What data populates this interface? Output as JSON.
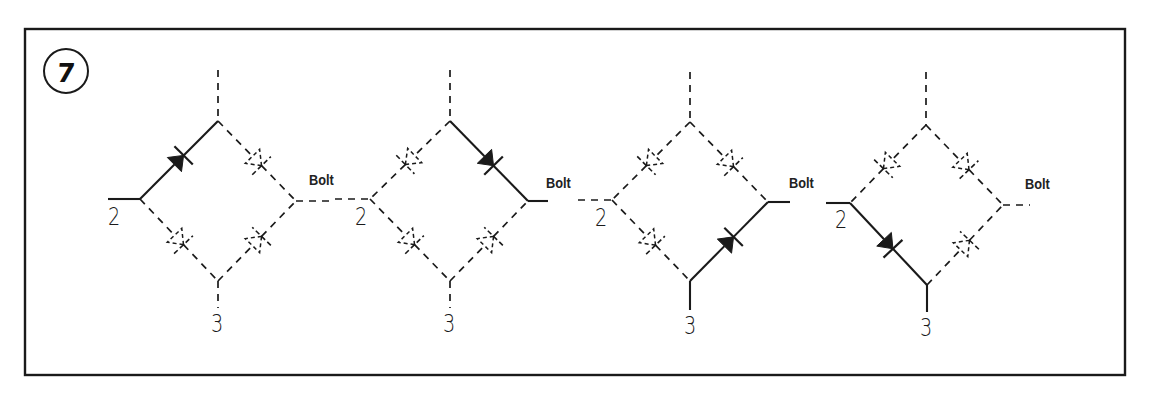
{
  "figure": {
    "number": "7",
    "frame": {
      "x": 25,
      "y": 29,
      "w": 1100,
      "h": 346
    },
    "stroke_color": "#1a1a1a",
    "background": "#ffffff"
  },
  "labels": {
    "terminal_1": "1",
    "terminal_2": "2",
    "terminal_3": "3",
    "output": "Bolt"
  },
  "bridges": [
    {
      "id": 1,
      "top": [
        218,
        121
      ],
      "left": [
        140,
        199
      ],
      "right": [
        296,
        201
      ],
      "bottom": [
        218,
        281
      ],
      "leads": {
        "top": {
          "from": [
            218,
            70
          ],
          "style": "dashed"
        },
        "left": {
          "from": [
            108,
            199
          ],
          "style": "solid"
        },
        "right": {
          "to": [
            330,
            201
          ],
          "style": "dashed"
        },
        "bottom": {
          "to": [
            218,
            308
          ],
          "style": "dashed"
        }
      },
      "edges": [
        {
          "a": "left",
          "b": "top",
          "conducting": true,
          "dir": "a_to_b"
        },
        {
          "a": "top",
          "b": "right",
          "conducting": false,
          "dir": "a_to_b"
        },
        {
          "a": "left",
          "b": "bottom",
          "conducting": false,
          "dir": "a_to_b"
        },
        {
          "a": "bottom",
          "b": "right",
          "conducting": false,
          "dir": "a_to_b"
        }
      ],
      "label_pos": {
        "two": [
          108,
          205
        ],
        "three": [
          211,
          312
        ],
        "bolt": [
          309,
          172
        ]
      }
    },
    {
      "id": 2,
      "top": [
        450,
        121
      ],
      "left": [
        370,
        199
      ],
      "right": [
        528,
        201
      ],
      "bottom": [
        450,
        281
      ],
      "leads": {
        "top": {
          "from": [
            450,
            70
          ],
          "style": "dashed"
        },
        "left": {
          "from": [
            335,
            199
          ],
          "style": "dashed"
        },
        "right": {
          "to": [
            548,
            201
          ],
          "style": "solid"
        },
        "bottom": {
          "to": [
            450,
            308
          ],
          "style": "dashed"
        }
      },
      "edges": [
        {
          "a": "left",
          "b": "top",
          "conducting": false,
          "dir": "b_to_a"
        },
        {
          "a": "top",
          "b": "right",
          "conducting": true,
          "dir": "a_to_b"
        },
        {
          "a": "left",
          "b": "bottom",
          "conducting": false,
          "dir": "a_to_b"
        },
        {
          "a": "bottom",
          "b": "right",
          "conducting": false,
          "dir": "a_to_b"
        }
      ],
      "label_pos": {
        "two": [
          355,
          205
        ],
        "three": [
          443,
          312
        ],
        "bolt": [
          546,
          175
        ]
      }
    },
    {
      "id": 3,
      "top": [
        690,
        122
      ],
      "left": [
        612,
        200
      ],
      "right": [
        768,
        202
      ],
      "bottom": [
        690,
        281
      ],
      "leads": {
        "top": {
          "from": [
            690,
            72
          ],
          "style": "dashed"
        },
        "left": {
          "from": [
            578,
            200
          ],
          "style": "dashed"
        },
        "right": {
          "to": [
            790,
            202
          ],
          "style": "solid"
        },
        "bottom": {
          "to": [
            690,
            310
          ],
          "style": "solid"
        }
      },
      "edges": [
        {
          "a": "left",
          "b": "top",
          "conducting": false,
          "dir": "b_to_a"
        },
        {
          "a": "top",
          "b": "right",
          "conducting": false,
          "dir": "a_to_b"
        },
        {
          "a": "left",
          "b": "bottom",
          "conducting": false,
          "dir": "a_to_b"
        },
        {
          "a": "bottom",
          "b": "right",
          "conducting": true,
          "dir": "a_to_b"
        }
      ],
      "label_pos": {
        "two": [
          595,
          206
        ],
        "three": [
          684,
          314
        ],
        "bolt": [
          789,
          175
        ]
      }
    },
    {
      "id": 4,
      "top": [
        926,
        125
      ],
      "left": [
        850,
        203
      ],
      "right": [
        1003,
        205
      ],
      "bottom": [
        927,
        285
      ],
      "leads": {
        "top": {
          "from": [
            926,
            72
          ],
          "style": "dashed"
        },
        "left": {
          "from": [
            826,
            203
          ],
          "style": "solid"
        },
        "right": {
          "to": [
            1030,
            205
          ],
          "style": "dashed"
        },
        "bottom": {
          "to": [
            927,
            312
          ],
          "style": "solid"
        }
      },
      "edges": [
        {
          "a": "left",
          "b": "top",
          "conducting": false,
          "dir": "b_to_a"
        },
        {
          "a": "top",
          "b": "right",
          "conducting": false,
          "dir": "a_to_b"
        },
        {
          "a": "left",
          "b": "bottom",
          "conducting": true,
          "dir": "a_to_b"
        },
        {
          "a": "bottom",
          "b": "right",
          "conducting": false,
          "dir": "a_to_b"
        }
      ],
      "label_pos": {
        "two": [
          835,
          208
        ],
        "three": [
          920,
          316
        ],
        "bolt": [
          1025,
          176
        ]
      }
    }
  ]
}
